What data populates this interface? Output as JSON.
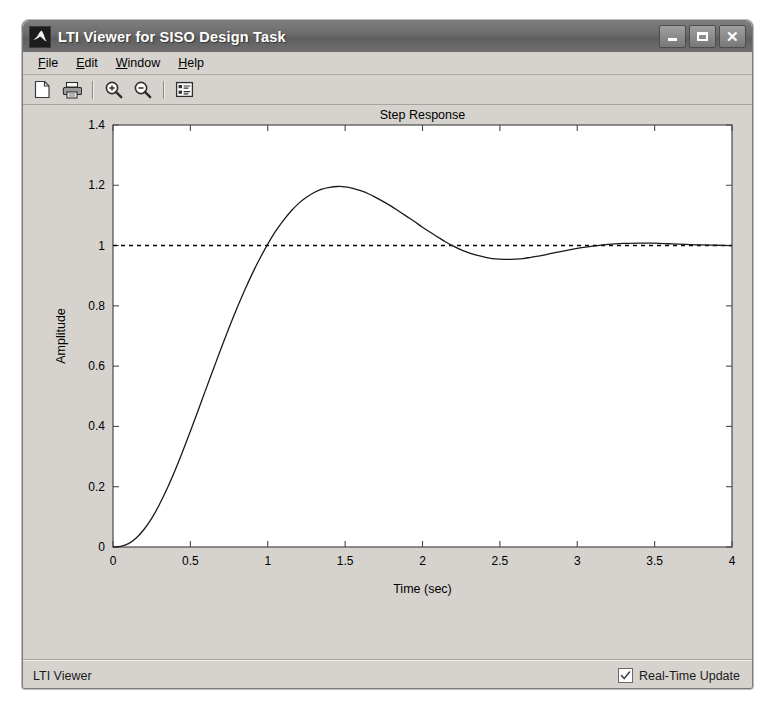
{
  "window": {
    "title": "LTI Viewer for SISO Design Task",
    "icon": "matlab-membrane-icon",
    "controls": {
      "minimize": "minimize-button",
      "maximize": "maximize-button",
      "close": "close-button",
      "close_glyph": "✕"
    }
  },
  "menubar": {
    "items": [
      {
        "label": "File",
        "mnemonic": "F"
      },
      {
        "label": "Edit",
        "mnemonic": "E"
      },
      {
        "label": "Window",
        "mnemonic": "W"
      },
      {
        "label": "Help",
        "mnemonic": "H"
      }
    ]
  },
  "toolbar": {
    "buttons": [
      {
        "name": "new-document-icon",
        "tooltip": "New"
      },
      {
        "name": "print-icon",
        "tooltip": "Print"
      },
      {
        "name": "zoom-in-icon",
        "tooltip": "Zoom In"
      },
      {
        "name": "zoom-out-icon",
        "tooltip": "Zoom Out"
      },
      {
        "name": "properties-icon",
        "tooltip": "Properties"
      }
    ]
  },
  "statusbar": {
    "text": "LTI Viewer",
    "realtime_label": "Real-Time Update",
    "realtime_checked": true
  },
  "colors": {
    "window_face": "#d6d3ce",
    "titlebar": "#6a6a6a",
    "plot_bg": "#ffffff",
    "curve": "#1a1a1a",
    "reference": "#000000"
  },
  "chart_data": {
    "type": "line",
    "title": "Step Response",
    "xlabel": "Time (sec)",
    "ylabel": "Amplitude",
    "xlim": [
      0,
      4
    ],
    "ylim": [
      0,
      1.4
    ],
    "xticks": [
      0,
      0.5,
      1,
      1.5,
      2,
      2.5,
      3,
      3.5,
      4
    ],
    "xticklabels": [
      "0",
      "0.5",
      "1",
      "1.5",
      "2",
      "2.5",
      "3",
      "3.5",
      "4"
    ],
    "yticks": [
      0,
      0.2,
      0.4,
      0.6,
      0.8,
      1,
      1.2,
      1.4
    ],
    "yticklabels": [
      "0",
      "0.2",
      "0.4",
      "0.6",
      "0.8",
      "1",
      "1.2",
      "1.4"
    ],
    "grid": false,
    "legend": null,
    "annotations": {
      "peak_amplitude": 1.2,
      "peak_time": 1.07,
      "rise_cross_one_time": 0.72,
      "undershoot_amplitude": 0.955,
      "undershoot_time": 2.1,
      "final_value": 1.0,
      "overshoot_percent": 20
    },
    "series": [
      {
        "name": "Step Response",
        "style": "solid",
        "x": [
          0,
          0.05,
          0.1,
          0.15,
          0.2,
          0.25,
          0.3,
          0.35,
          0.4,
          0.45,
          0.5,
          0.55,
          0.6,
          0.65,
          0.7,
          0.75,
          0.8,
          0.85,
          0.9,
          0.95,
          1,
          1.05,
          1.1,
          1.15,
          1.2,
          1.25,
          1.3,
          1.35,
          1.4,
          1.45,
          1.5,
          1.55,
          1.6,
          1.65,
          1.7,
          1.75,
          1.8,
          1.85,
          1.9,
          1.95,
          2,
          2.05,
          2.1,
          2.15,
          2.2,
          2.25,
          2.3,
          2.35,
          2.4,
          2.45,
          2.5,
          2.55,
          2.6,
          2.65,
          2.7,
          2.75,
          2.8,
          2.85,
          2.9,
          2.95,
          3,
          3.1,
          3.2,
          3.3,
          3.4,
          3.5,
          3.6,
          3.7,
          3.8,
          3.9,
          4
        ],
        "y": [
          0,
          0.002,
          0.011,
          0.03,
          0.058,
          0.095,
          0.141,
          0.194,
          0.253,
          0.317,
          0.384,
          0.453,
          0.523,
          0.592,
          0.661,
          0.727,
          0.791,
          0.851,
          0.907,
          0.958,
          1.005,
          1.047,
          1.083,
          1.114,
          1.14,
          1.16,
          1.176,
          1.187,
          1.193,
          1.196,
          1.195,
          1.19,
          1.182,
          1.172,
          1.159,
          1.145,
          1.13,
          1.113,
          1.096,
          1.079,
          1.061,
          1.044,
          1.028,
          1.012,
          0.998,
          0.986,
          0.976,
          0.968,
          0.962,
          0.957,
          0.955,
          0.954,
          0.955,
          0.957,
          0.961,
          0.965,
          0.97,
          0.976,
          0.981,
          0.986,
          0.991,
          0.998,
          1.004,
          1.007,
          1.008,
          1.008,
          1.006,
          1.004,
          1.002,
          1.001,
          1.0
        ]
      },
      {
        "name": "Final Value Reference",
        "style": "dotted",
        "x": [
          0,
          4
        ],
        "y": [
          1,
          1
        ]
      }
    ]
  }
}
